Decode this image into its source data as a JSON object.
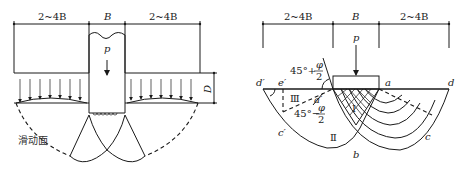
{
  "left_figure": {
    "dimensions": [
      "2~4B",
      "B",
      "2~4B"
    ],
    "load_label": "p",
    "depth_label": "D",
    "slip_surface_label": "滑动面"
  },
  "right_figure": {
    "dimensions": [
      "2~4B",
      "B",
      "2~4B"
    ],
    "load_label": "p",
    "angle_top": {
      "prefix": "45°+",
      "num": "φ",
      "den": "2"
    },
    "angle_bottom": {
      "prefix": "45°−",
      "num": "φ",
      "den": "2"
    },
    "points": {
      "d_prime": "d′",
      "e_prime": "e′",
      "a": "a",
      "d": "d",
      "a_prime": "a′",
      "c_prime": "c′",
      "c": "c",
      "b": "b"
    },
    "zones": {
      "I": "Ⅰ",
      "II": "Ⅱ",
      "III": "Ⅲ"
    }
  }
}
